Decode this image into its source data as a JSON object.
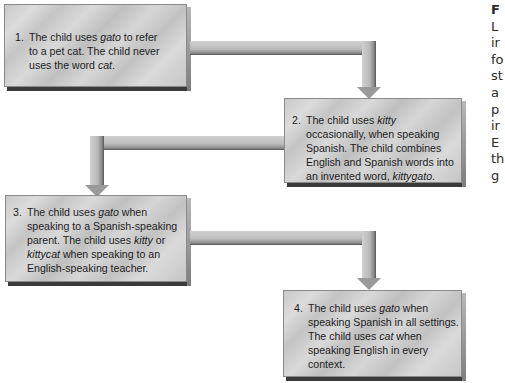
{
  "diagram": {
    "steps": [
      {
        "number": "1.",
        "lines": [
          [
            {
              "t": "The child uses "
            },
            {
              "t": "gato",
              "i": true
            },
            {
              "t": " to refer"
            }
          ],
          [
            {
              "t": "to a pet cat. The child never"
            }
          ],
          [
            {
              "t": "uses the word "
            },
            {
              "t": "cat",
              "i": true
            },
            {
              "t": "."
            }
          ]
        ]
      },
      {
        "number": "2.",
        "lines": [
          [
            {
              "t": "The child uses "
            },
            {
              "t": "kitty",
              "i": true
            }
          ],
          [
            {
              "t": "occasionally, when speaking"
            }
          ],
          [
            {
              "t": "Spanish. The child combines"
            }
          ],
          [
            {
              "t": "English and Spanish words into"
            }
          ],
          [
            {
              "t": "an invented word, "
            },
            {
              "t": "kittygato",
              "i": true
            },
            {
              "t": "."
            }
          ]
        ]
      },
      {
        "number": "3.",
        "lines": [
          [
            {
              "t": "The child uses "
            },
            {
              "t": "gato",
              "i": true
            },
            {
              "t": " when"
            }
          ],
          [
            {
              "t": "speaking to a Spanish-speaking"
            }
          ],
          [
            {
              "t": "parent. The child uses "
            },
            {
              "t": "kitty",
              "i": true
            },
            {
              "t": " or"
            }
          ],
          [
            {
              "t": "kittycat",
              "i": true
            },
            {
              "t": " when speaking to an"
            }
          ],
          [
            {
              "t": "English-speaking teacher."
            }
          ]
        ]
      },
      {
        "number": "4.",
        "lines": [
          [
            {
              "t": "The child uses "
            },
            {
              "t": "gato",
              "i": true
            },
            {
              "t": " when"
            }
          ],
          [
            {
              "t": "speaking Spanish in all settings."
            }
          ],
          [
            {
              "t": "The child uses "
            },
            {
              "t": "cat",
              "i": true
            },
            {
              "t": " when"
            }
          ],
          [
            {
              "t": "speaking English in every"
            }
          ],
          [
            {
              "t": "context."
            }
          ]
        ]
      }
    ],
    "arrows": [
      {
        "from": 1,
        "to": 2
      },
      {
        "from": 2,
        "to": 3
      },
      {
        "from": 3,
        "to": 4
      }
    ]
  },
  "side_caption": {
    "lines": [
      "F",
      "L",
      "ir",
      "fo",
      "st",
      "a",
      "p",
      "ir",
      "E",
      "th",
      "g"
    ]
  },
  "colors": {
    "box_fill": "#cdcdcd",
    "box_shadow": "#3e3e3e",
    "arrow": "#b5b5b5",
    "text": "#1d1d1d"
  }
}
